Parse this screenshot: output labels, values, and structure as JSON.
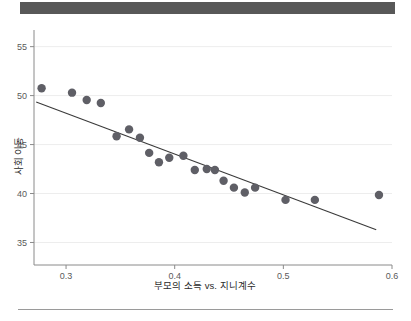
{
  "header": {
    "bar_color": "#585858"
  },
  "footer": {
    "divider_color": "#9a9a9a"
  },
  "chart_data": {
    "type": "scatter",
    "title": "",
    "subtitle": "",
    "xlabel": "부모의 소득 vs. 지니계수",
    "ylabel": "사회 이동",
    "xlim": [
      0.2705,
      0.6
    ],
    "ylim": [
      32.7,
      56.7
    ],
    "xticks": [
      0.3,
      0.4,
      0.5,
      0.6
    ],
    "xticklabels": [
      "0.3",
      "0.4",
      "0.5",
      "0.6"
    ],
    "yticks": [
      35,
      40,
      45,
      50,
      55
    ],
    "yticklabels": [
      "35",
      "40",
      "45",
      "50",
      "55"
    ],
    "grid": "horizontal",
    "grid_color": "#ededed",
    "legend": "none",
    "point_color": "#5f5f66",
    "point_size": 4.2,
    "line_color": "#3a3a3a",
    "x": [
      0.2775,
      0.3055,
      0.319,
      0.332,
      0.3465,
      0.358,
      0.368,
      0.3765,
      0.3855,
      0.395,
      0.408,
      0.4185,
      0.4295,
      0.437,
      0.445,
      0.4545,
      0.4645,
      0.474,
      0.502,
      0.529,
      0.588
    ],
    "y": [
      50.75,
      50.3,
      49.55,
      49.25,
      45.85,
      46.55,
      45.7,
      44.15,
      43.2,
      43.65,
      43.85,
      42.4,
      42.5,
      42.4,
      41.3,
      40.6,
      40.1,
      40.6,
      39.35,
      39.35,
      39.85
    ],
    "trendline": {
      "x": [
        0.2725,
        0.5855
      ],
      "y": [
        49.35,
        36.3
      ]
    }
  }
}
